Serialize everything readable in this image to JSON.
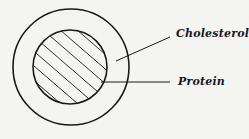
{
  "diagram": {
    "type": "concentric-circles",
    "labels": {
      "outer": "Cholesterol",
      "inner": "Protein"
    },
    "colors": {
      "background": "#f4f4f2",
      "stroke": "#1a1a1a"
    }
  }
}
